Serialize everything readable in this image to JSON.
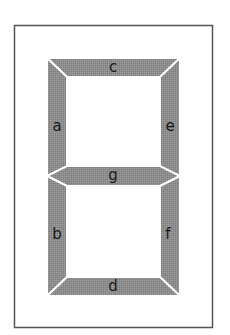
{
  "diagram": {
    "colors": {
      "segment_fill": "#8f8f8f",
      "frame_stroke": "#555555",
      "background": "#ffffff",
      "label": "#1a1a1a"
    },
    "segments": [
      {
        "id": "a",
        "label": "a",
        "position": "upper-left"
      },
      {
        "id": "b",
        "label": "b",
        "position": "lower-left"
      },
      {
        "id": "c",
        "label": "c",
        "position": "top"
      },
      {
        "id": "d",
        "label": "d",
        "position": "bottom"
      },
      {
        "id": "e",
        "label": "e",
        "position": "upper-right"
      },
      {
        "id": "f",
        "label": "f",
        "position": "lower-right"
      },
      {
        "id": "g",
        "label": "g",
        "position": "middle"
      }
    ]
  }
}
